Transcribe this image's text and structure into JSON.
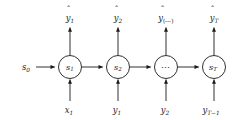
{
  "figure": {
    "type": "recurrent-neural-network-unrolled-chain",
    "background_color": "#ffffff",
    "stroke_color": "#1a1a1a",
    "initial_state": {
      "base": "s",
      "sub": "0",
      "label": "s0"
    },
    "nodes": [
      {
        "id": "s1",
        "base": "s",
        "sub": "1",
        "is_ellipsis": false,
        "cx": 70,
        "cy": 67,
        "r": 11.5
      },
      {
        "id": "s2",
        "base": "s",
        "sub": "2",
        "is_ellipsis": false,
        "cx": 118,
        "cy": 67,
        "r": 11.5
      },
      {
        "id": "sdots",
        "base": "",
        "sub": "",
        "is_ellipsis": true,
        "ellipsis": "⋯",
        "cx": 166,
        "cy": 67,
        "r": 11.5
      },
      {
        "id": "sT",
        "base": "s",
        "sub": "T",
        "is_ellipsis": false,
        "cx": 214,
        "cy": 67,
        "r": 11.5
      }
    ],
    "outputs": [
      {
        "id": "yhat1",
        "base": "y",
        "sub": "1",
        "sub_style": "italic",
        "hat": "ˆ",
        "x": 70,
        "y": 16
      },
      {
        "id": "yhat2",
        "base": "y",
        "sub": "2",
        "sub_style": "italic",
        "hat": "ˆ",
        "x": 118,
        "y": 16
      },
      {
        "id": "yhatdots",
        "base": "y",
        "sub": "(⋯)",
        "sub_style": "normal",
        "hat": "ˆ",
        "x": 166,
        "y": 16
      },
      {
        "id": "yhatT",
        "base": "y",
        "sub": "T",
        "sub_style": "italic",
        "hat": "ˆ",
        "x": 214,
        "y": 16
      }
    ],
    "inputs": [
      {
        "id": "x1",
        "base": "x",
        "sub": "1",
        "sub_style": "italic",
        "x": 70,
        "y": 111
      },
      {
        "id": "y1",
        "base": "y",
        "sub": "1",
        "sub_style": "italic",
        "x": 118,
        "y": 111
      },
      {
        "id": "y2",
        "base": "y",
        "sub": "2",
        "sub_style": "italic",
        "x": 166,
        "y": 111
      },
      {
        "id": "yTm1",
        "base": "y",
        "sub": "T−1",
        "sub_style": "italic",
        "x": 214,
        "y": 111
      }
    ],
    "edges": {
      "horizontal": "left-to-right state transitions",
      "vertical_up": "state to predicted output",
      "vertical_down_in": "observed input to state"
    }
  }
}
